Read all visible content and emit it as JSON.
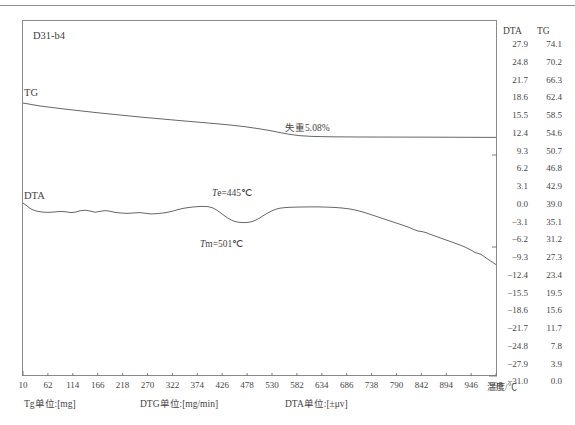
{
  "figure": {
    "sample_id": "D31-b4",
    "curve_labels": {
      "tg": "TG",
      "dta": "DTA"
    },
    "annotations": {
      "weight_loss": "失重5.08%",
      "onset": "Te=445℃",
      "peak": "Tm=501℃",
      "onset_italic": "T",
      "onset_rest": "e=445℃",
      "peak_italic": "T",
      "peak_rest": "m=501℃"
    },
    "axis": {
      "x_title": "温度/℃",
      "x_ticks": [
        10,
        62,
        114,
        166,
        218,
        270,
        322,
        374,
        426,
        478,
        530,
        582,
        634,
        686,
        738,
        790,
        842,
        894,
        946,
        998
      ],
      "right_columns": {
        "headers": [
          "DTA",
          "TG"
        ],
        "dta_values": [
          "27.9",
          "24.8",
          "21.7",
          "18.6",
          "15.5",
          "12.4",
          "9.3",
          "6.2",
          "3.1",
          "0.0",
          "-3.1",
          "-6.2",
          "-9.3",
          "-12.4",
          "-15.5",
          "-18.6",
          "-21.7",
          "-24.8",
          "-27.9",
          "-31.0"
        ],
        "tg_values": [
          "74.1",
          "70.2",
          "66.3",
          "62.4",
          "58.5",
          "54.6",
          "50.7",
          "46.8",
          "42.9",
          "39.0",
          "35.1",
          "31.2",
          "27.3",
          "23.4",
          "19.5",
          "15.6",
          "11.7",
          "7.8",
          "3.9",
          "0.0"
        ]
      }
    },
    "units": {
      "tg": "Tg单位:[mg]",
      "dtg": "DTG单位:[mg/min]",
      "dta": "DTA单位:[±μv]"
    },
    "colors": {
      "curve": "#555555",
      "frame": "#8a8a8a",
      "text": "#3f3f3f"
    }
  },
  "chart_data": {
    "type": "line",
    "title": "D31-b4",
    "xlabel": "温度/℃",
    "ylabel": "DTA [±μv] / TG [mg]",
    "xlim": [
      10,
      1024
    ],
    "grid": false,
    "legend": "inline-curve-labels",
    "series": [
      {
        "name": "TG",
        "unit": "mg",
        "axis": "tg",
        "note": "失重5.08%",
        "x": [
          10,
          62,
          114,
          166,
          218,
          270,
          322,
          374,
          426,
          478,
          530,
          582,
          634,
          686,
          738,
          790,
          842,
          894,
          946,
          998,
          1024
        ],
        "y": [
          62.4,
          61.6,
          60.9,
          60.3,
          59.7,
          59.1,
          58.5,
          57.9,
          57.2,
          56.3,
          55.2,
          54.7,
          54.6,
          54.6,
          54.6,
          54.6,
          54.6,
          54.6,
          54.6,
          54.6,
          54.6
        ]
      },
      {
        "name": "DTA",
        "unit": "±μv",
        "axis": "dta",
        "annotations": [
          {
            "label": "Te=445℃",
            "x": 445,
            "kind": "onset"
          },
          {
            "label": "Tm=501℃",
            "x": 501,
            "kind": "peak-minimum"
          }
        ],
        "x": [
          10,
          62,
          114,
          166,
          218,
          270,
          322,
          374,
          426,
          478,
          530,
          582,
          634,
          686,
          738,
          790,
          842,
          894,
          946,
          998,
          1024
        ],
        "y": [
          1.2,
          -1.0,
          -1.3,
          -0.9,
          -1.4,
          -1.1,
          -1.6,
          -1.5,
          -0.4,
          -3.4,
          -4.6,
          -1.0,
          -0.5,
          -0.6,
          -1.2,
          -3.6,
          -6.2,
          -8.4,
          -10.4,
          -12.0,
          -12.6
        ]
      }
    ]
  }
}
